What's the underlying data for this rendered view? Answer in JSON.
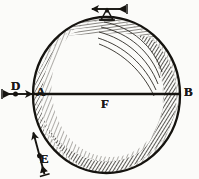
{
  "figure": {
    "kind": "engraved-diagram",
    "background_color": "#fbfbf9",
    "ink_color": "#1c1a17",
    "labels": [
      {
        "id": "D",
        "text": "D",
        "role": "left-arrow-label"
      },
      {
        "id": "A",
        "text": "A",
        "role": "sphere-left-point-label"
      },
      {
        "id": "F",
        "text": "F",
        "role": "sphere-center-label"
      },
      {
        "id": "B",
        "text": "B",
        "role": "sphere-right-point-label"
      },
      {
        "id": "E",
        "text": "E",
        "role": "lower-left-arrow-label"
      }
    ],
    "sphere": {
      "center_x": 106.5,
      "center_y": 95,
      "radius_x": 73.5,
      "radius_y": 78,
      "outline_width": 2.2,
      "shading": "crescent-hatching-right-and-bottom"
    },
    "diameter_line": {
      "from_label": "A",
      "to_label": "B",
      "midpoint_label": "F",
      "y": 94,
      "x_start": 33,
      "x_end": 181,
      "thickness": 2.4
    },
    "arrows": [
      {
        "id": "arrow-D",
        "label": "D",
        "direction": "right",
        "has_bead": true,
        "x": 5,
        "y": 94
      },
      {
        "id": "arrow-E",
        "label": "E",
        "direction": "up-right",
        "has_bead": true,
        "x": 38,
        "y": 168
      },
      {
        "id": "arrow-top",
        "label": "",
        "direction": "left",
        "has_bead": false,
        "mounted_on": "sphere-top",
        "x": 107,
        "y": 13
      }
    ]
  }
}
